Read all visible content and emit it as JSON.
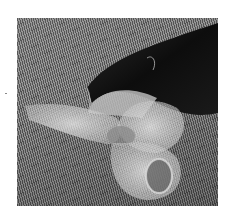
{
  "image": {
    "description": "Grayscale photograph of a translucent wire-mesh bow-shaped sculpture resting on a dark cylindrical form, with a diagonal moire stripe background",
    "palette": {
      "background": "#ffffff",
      "stripe_dark": "#4a4a4a",
      "stripe_light": "#9a9a9a",
      "cylinder_dark": "#111111",
      "mesh_light": "#d8d8d8"
    }
  }
}
